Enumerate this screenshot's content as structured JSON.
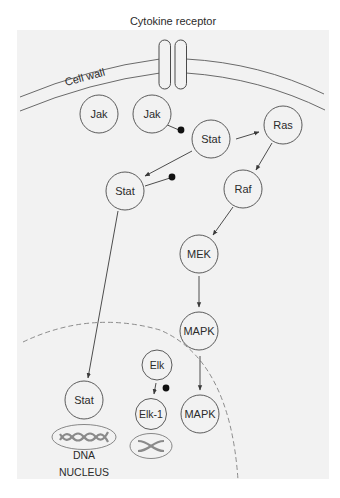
{
  "colors": {
    "page_background": "#ffffff",
    "panel_background": "#f2f2f2",
    "stroke": "#4a4a4a",
    "dna_stroke": "#8a8a8a",
    "dot": "#111111",
    "dashed_nucleus": "#808080"
  },
  "labels": {
    "cytokine_receptor": "Cytokine receptor",
    "cell_wall": "Cell wall",
    "dna": "DNA",
    "nucleus": "NUCLEUS"
  },
  "nodes": {
    "jak_1": {
      "label": "Jak"
    },
    "jak_2": {
      "label": "Jak"
    },
    "stat_1": {
      "label": "Stat"
    },
    "ras": {
      "label": "Ras"
    },
    "stat_2": {
      "label": "Stat"
    },
    "raf": {
      "label": "Raf"
    },
    "mek": {
      "label": "MEK"
    },
    "mapk_1": {
      "label": "MAPK"
    },
    "elk": {
      "label": "Elk"
    },
    "stat_3": {
      "label": "Stat"
    },
    "elk_1": {
      "label": "Elk-1"
    },
    "mapk_2": {
      "label": "MAPK"
    }
  },
  "edges": [
    {
      "from": "Jak",
      "to": "Stat",
      "type": "phosphorylation"
    },
    {
      "from": "Stat",
      "to": "Ras",
      "type": "arrow"
    },
    {
      "from": "Stat",
      "to": "Stat",
      "type": "arrow"
    },
    {
      "from": "Stat",
      "to": "Stat (nucleus)",
      "type": "arrow"
    },
    {
      "from": "Ras",
      "to": "Raf",
      "type": "arrow"
    },
    {
      "from": "Raf",
      "to": "MEK",
      "type": "arrow"
    },
    {
      "from": "MEK",
      "to": "MAPK",
      "type": "arrow"
    },
    {
      "from": "MAPK",
      "to": "MAPK (nucleus)",
      "type": "arrow"
    },
    {
      "from": "Elk",
      "to": "Elk-1",
      "type": "arrow"
    }
  ]
}
